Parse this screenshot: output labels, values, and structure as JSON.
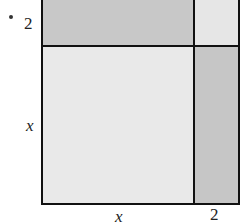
{
  "diagram": {
    "bullet": "•",
    "labels": {
      "left_top": "2",
      "left_bottom": "x",
      "bottom_left": "x",
      "bottom_right": "2"
    },
    "regions": [
      {
        "id": "top-left",
        "dims": "x by 2",
        "color": "#c8c8c8"
      },
      {
        "id": "top-right",
        "dims": "2 by 2",
        "color": "#e6e6e6"
      },
      {
        "id": "bottom-left",
        "dims": "x by x",
        "color": "#e9e9e9"
      },
      {
        "id": "bottom-right",
        "dims": "2 by x",
        "color": "#c6c6c6"
      }
    ],
    "colors": {
      "border": "#111111",
      "background": "#ffffff"
    }
  }
}
